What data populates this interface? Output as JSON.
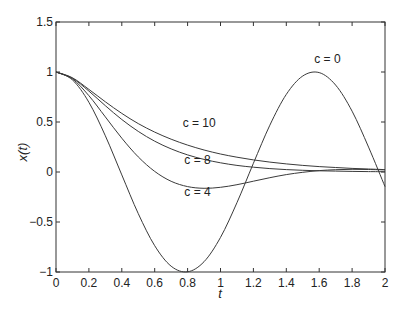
{
  "chart_data": {
    "type": "line",
    "title": "",
    "xlabel": "t",
    "ylabel": "x(t)",
    "xlim": [
      0,
      2
    ],
    "ylim": [
      -1,
      1.5
    ],
    "grid": false,
    "legend": "none (inline curve annotations)",
    "x_ticks": [
      "0",
      "0.2",
      "0.4",
      "0.6",
      "0.8",
      "1",
      "1.2",
      "1.4",
      "1.6",
      "1.8",
      "2"
    ],
    "y_ticks": [
      "−1",
      "−0.5",
      "0",
      "0.5",
      "1",
      "1.5"
    ],
    "x_tick_values": [
      0,
      0.2,
      0.4,
      0.6,
      0.8,
      1,
      1.2,
      1.4,
      1.6,
      1.8,
      2
    ],
    "y_tick_values": [
      -1,
      -0.5,
      0,
      0.5,
      1,
      1.5
    ],
    "x": [
      0,
      0.1,
      0.2,
      0.3,
      0.4,
      0.5,
      0.6,
      0.7,
      0.8,
      0.9,
      1.0,
      1.1,
      1.2,
      1.3,
      1.4,
      1.5,
      1.6,
      1.7,
      1.8,
      1.9,
      2.0
    ],
    "series": [
      {
        "name": "c = 0",
        "label_pos": [
          1.57,
          1.09
        ],
        "values": [
          1,
          0.921,
          0.697,
          0.362,
          -0.029,
          -0.416,
          -0.737,
          -0.942,
          -0.998,
          -0.897,
          -0.654,
          -0.307,
          0.087,
          0.468,
          0.776,
          0.96,
          0.994,
          0.869,
          0.608,
          0.249,
          -0.146
        ]
      },
      {
        "name": "c = 4",
        "label_pos": [
          0.78,
          -0.24
        ],
        "values": [
          1,
          0.931,
          0.763,
          0.551,
          0.338,
          0.151,
          0.006,
          -0.093,
          -0.146,
          -0.163,
          -0.153,
          -0.127,
          -0.092,
          -0.057,
          -0.026,
          -0.003,
          0.014,
          0.023,
          0.027,
          0.025,
          0.021
        ]
      },
      {
        "name": "c = 8",
        "label_pos": [
          0.78,
          0.08
        ],
        "values": [
          1,
          0.938,
          0.809,
          0.663,
          0.525,
          0.406,
          0.308,
          0.231,
          0.171,
          0.126,
          0.092,
          0.066,
          0.048,
          0.034,
          0.024,
          0.017,
          0.012,
          0.009,
          0.006,
          0.004,
          0.003
        ]
      },
      {
        "name": "c = 10",
        "label_pos": [
          0.77,
          0.45
        ],
        "values": [
          1,
          0.942,
          0.826,
          0.702,
          0.586,
          0.484,
          0.399,
          0.328,
          0.269,
          0.22,
          0.18,
          0.148,
          0.121,
          0.099,
          0.081,
          0.066,
          0.054,
          0.045,
          0.036,
          0.03,
          0.024
        ]
      }
    ]
  },
  "colors": {
    "axis": "#333333",
    "curve": "#3a3a3a",
    "background": "#ffffff"
  }
}
